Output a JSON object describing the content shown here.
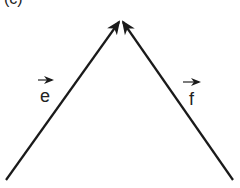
{
  "figure": {
    "panel_label": "(c)",
    "vectors": [
      {
        "name": "e",
        "label": "e",
        "from": [
          6,
          180
        ],
        "to": [
          121,
          18
        ]
      },
      {
        "name": "f",
        "label": "f",
        "from": [
          233,
          180
        ],
        "to": [
          121,
          18
        ]
      }
    ],
    "stroke_color": "#1a1a1a"
  }
}
